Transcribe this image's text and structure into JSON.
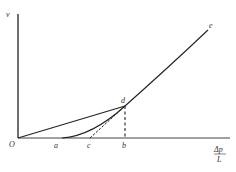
{
  "diagram": {
    "type": "flow-velocity vs pressure-gradient curve",
    "axes": {
      "y_label": "v",
      "x_label_numerator": "Δp",
      "x_label_denominator": "L",
      "origin_label": "O"
    },
    "points": {
      "a": "a",
      "c": "c",
      "b": "b",
      "d": "d",
      "e": "e"
    },
    "elements": [
      {
        "kind": "line",
        "from": "O",
        "to": "d",
        "style": "solid"
      },
      {
        "kind": "curve",
        "from": "a",
        "through": "d",
        "to": "e",
        "style": "solid"
      },
      {
        "kind": "tangent",
        "from": "c",
        "to": "d",
        "style": "dashed"
      },
      {
        "kind": "vertical",
        "from": "d",
        "to": "b",
        "style": "dashed"
      }
    ],
    "colors": {
      "line": "#222222",
      "axis": "#333333",
      "text": "#333333"
    }
  }
}
